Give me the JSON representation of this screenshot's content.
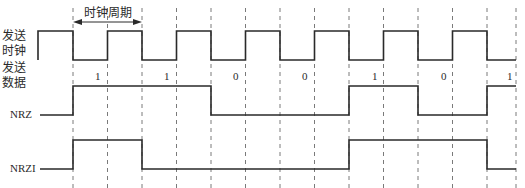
{
  "labels": {
    "clock_line1": "发送",
    "clock_line2": "时钟",
    "data_line1": "发送",
    "data_line2": "数据",
    "nrz": "NRZ",
    "nrzi": "NRZI",
    "clock_period": "时钟周期"
  },
  "bits": [
    "1",
    "1",
    "0",
    "0",
    "1",
    "0",
    "1"
  ],
  "colors": {
    "line": "#2a2a2a",
    "dash": "#7a7a7a",
    "background": "#ffffff"
  },
  "timing": {
    "start_x": 73,
    "period_half": 34.5,
    "boundaries": 14
  },
  "waveforms": {
    "clock": "high-low alternating, starts high",
    "nrz_levels": [
      1,
      1,
      0,
      0,
      1,
      0,
      1
    ],
    "nrzi_levels": [
      1,
      0,
      0,
      1,
      1,
      0,
      0
    ]
  }
}
